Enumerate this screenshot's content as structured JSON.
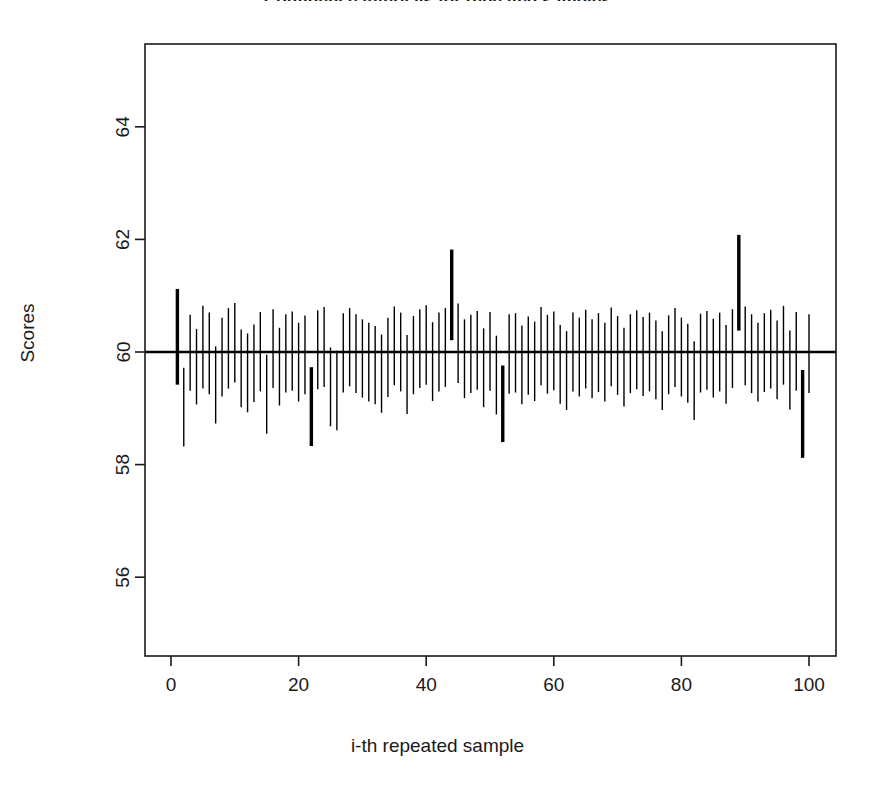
{
  "chart_data": {
    "type": "line",
    "title": "Confidence intervals for repeated samples",
    "xlabel": "i-th repeated sample",
    "ylabel": "Scores",
    "xlim": [
      -2,
      103
    ],
    "ylim": [
      54.8,
      65.3
    ],
    "xticks": [
      0,
      20,
      40,
      60,
      80,
      100
    ],
    "yticks": [
      56,
      58,
      60,
      62,
      64
    ],
    "grid": false,
    "legend": null,
    "reference_line": {
      "label": "true mean",
      "y": 60,
      "orientation": "horizontal",
      "linewidth": 2.4,
      "color": "#000000"
    },
    "series": [
      {
        "name": "confidence intervals",
        "kind": "vertical-interval-segments",
        "x": [
          1,
          2,
          3,
          4,
          5,
          6,
          7,
          8,
          9,
          10,
          11,
          12,
          13,
          14,
          15,
          16,
          17,
          18,
          19,
          20,
          21,
          22,
          23,
          24,
          25,
          26,
          27,
          28,
          29,
          30,
          31,
          32,
          33,
          34,
          35,
          36,
          37,
          38,
          39,
          40,
          41,
          42,
          43,
          44,
          45,
          46,
          47,
          48,
          49,
          50,
          51,
          52,
          53,
          54,
          55,
          56,
          57,
          58,
          59,
          60,
          61,
          62,
          63,
          64,
          65,
          66,
          67,
          68,
          69,
          70,
          71,
          72,
          73,
          74,
          75,
          76,
          77,
          78,
          79,
          80,
          81,
          82,
          83,
          84,
          85,
          86,
          87,
          88,
          89,
          90,
          91,
          92,
          93,
          94,
          95,
          96,
          97,
          98,
          99,
          100
        ],
        "lower": [
          59.42,
          58.32,
          59.31,
          59.07,
          59.35,
          59.25,
          58.73,
          59.21,
          59.35,
          59.46,
          59.02,
          58.93,
          59.11,
          59.3,
          58.55,
          59.36,
          59.05,
          59.28,
          59.31,
          59.12,
          59.25,
          58.33,
          59.34,
          59.38,
          58.68,
          58.61,
          59.28,
          59.39,
          59.27,
          59.19,
          59.12,
          59.07,
          58.92,
          59.2,
          59.41,
          59.3,
          58.9,
          59.25,
          59.36,
          59.42,
          59.13,
          59.3,
          59.38,
          60.21,
          59.45,
          59.18,
          59.27,
          59.33,
          59.02,
          59.31,
          58.89,
          58.4,
          59.26,
          59.28,
          59.07,
          59.24,
          59.13,
          59.41,
          59.26,
          59.32,
          59.08,
          58.97,
          59.3,
          59.21,
          59.35,
          59.18,
          59.29,
          59.12,
          59.39,
          59.24,
          59.03,
          59.27,
          59.34,
          59.22,
          59.3,
          59.16,
          58.97,
          59.25,
          59.38,
          59.21,
          59.1,
          58.79,
          59.28,
          59.33,
          59.19,
          59.3,
          59.08,
          59.36,
          60.38,
          59.41,
          59.27,
          59.12,
          59.29,
          59.35,
          59.16,
          59.42,
          58.98,
          59.31,
          58.12,
          59.27
        ],
        "upper": [
          61.12,
          59.72,
          60.66,
          60.41,
          60.82,
          60.7,
          60.1,
          60.61,
          60.78,
          60.87,
          60.4,
          60.33,
          60.49,
          60.71,
          59.95,
          60.76,
          60.43,
          60.67,
          60.72,
          60.52,
          60.65,
          59.73,
          60.74,
          60.8,
          60.08,
          60.02,
          60.69,
          60.78,
          60.67,
          60.58,
          60.52,
          60.46,
          60.31,
          60.61,
          60.81,
          60.7,
          60.3,
          60.64,
          60.76,
          60.83,
          60.53,
          60.7,
          60.78,
          61.82,
          60.86,
          60.58,
          60.66,
          60.73,
          60.42,
          60.71,
          60.29,
          59.76,
          60.67,
          60.69,
          60.47,
          60.63,
          60.54,
          60.8,
          60.66,
          60.72,
          60.48,
          60.37,
          60.7,
          60.61,
          60.75,
          60.58,
          60.69,
          60.52,
          60.79,
          60.64,
          60.43,
          60.67,
          60.74,
          60.62,
          60.7,
          60.56,
          60.37,
          60.65,
          60.78,
          60.61,
          60.5,
          60.19,
          60.68,
          60.73,
          60.59,
          60.7,
          60.48,
          60.76,
          62.08,
          60.81,
          60.67,
          60.52,
          60.69,
          60.75,
          60.56,
          60.82,
          60.38,
          60.71,
          59.68,
          60.67
        ],
        "highlighted": [
          1,
          22,
          44,
          52,
          89,
          99
        ],
        "highlight_meaning": "interval does not contain the reference value 60",
        "normal_linewidth": 1.4,
        "highlight_linewidth": 3.4,
        "color": "#000000"
      }
    ]
  },
  "geometry": {
    "plot_left": 145,
    "plot_right": 836,
    "plot_top": 44,
    "plot_bottom": 656,
    "x0_px": 171,
    "x_px_per_unit": 6.38,
    "y60_px": 352,
    "y_px_per_unit": 56.3,
    "tick_len": 10
  }
}
